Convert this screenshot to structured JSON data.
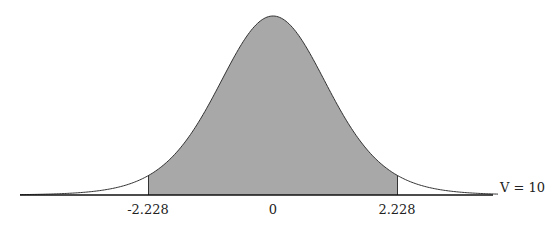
{
  "chart_data": {
    "type": "area",
    "distribution": "Student t",
    "degrees_of_freedom_label": "V = 10",
    "degrees_of_freedom": 10,
    "shaded_region": [
      -2.228,
      2.228
    ],
    "tick_labels": [
      "-2.228",
      "0",
      "2.228"
    ],
    "tick_values": [
      -2.228,
      0,
      2.228
    ],
    "xlim": [
      -3.9,
      3.9
    ],
    "fill_color": "#a8a8a8",
    "line_color": "#333333"
  },
  "labels": {
    "left_critical": "-2.228",
    "center": "0",
    "right_critical": "2.228",
    "df": "V = 10"
  }
}
